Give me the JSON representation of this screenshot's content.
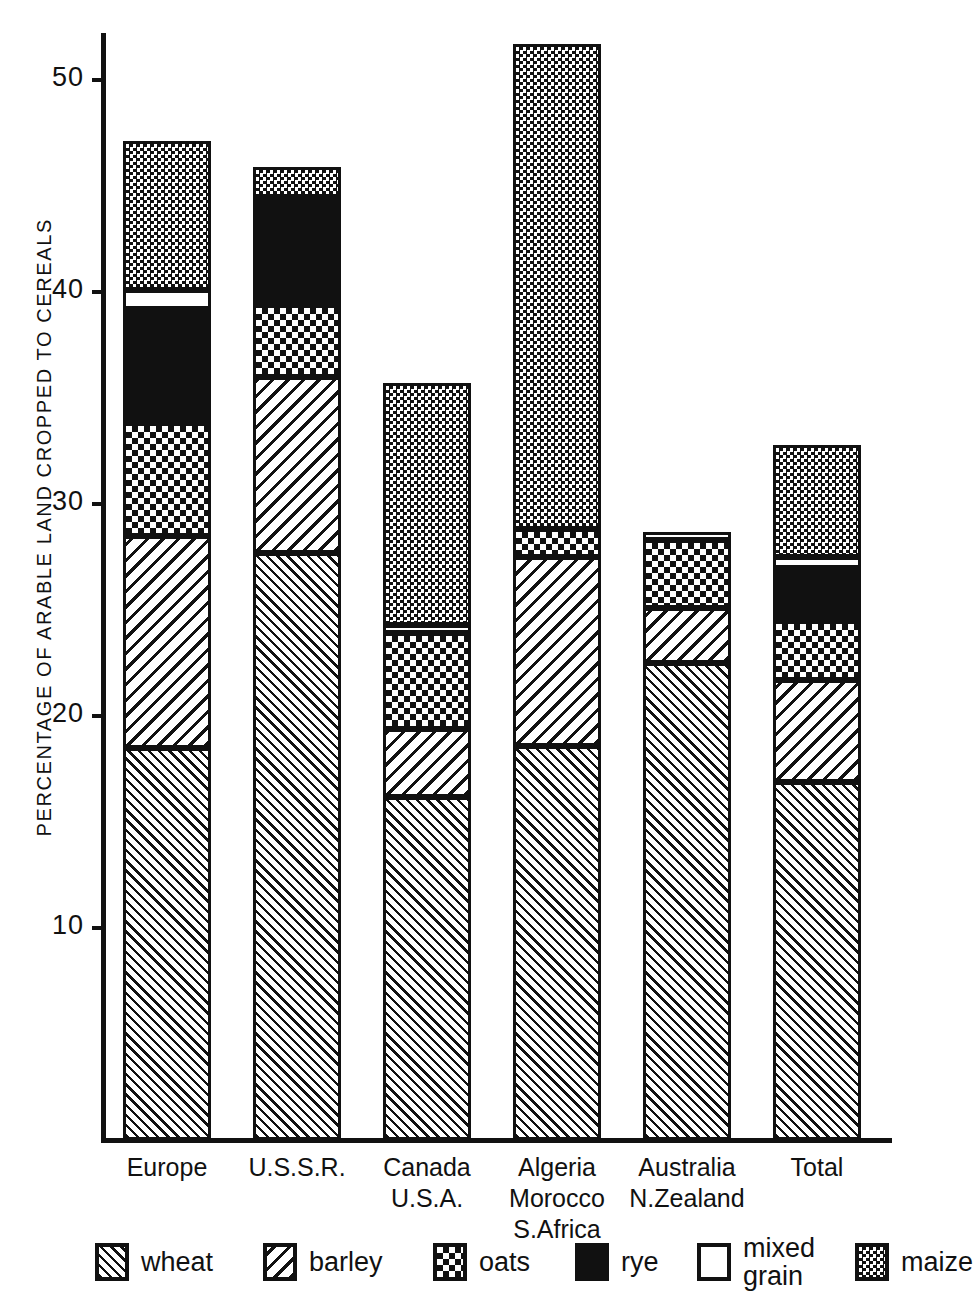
{
  "chart_data": {
    "type": "bar",
    "subtype": "stacked-bar",
    "title": "",
    "xlabel": "",
    "ylabel": "PERCENTAGE OF ARABLE LAND CROPPED TO CEREALS",
    "ylim": [
      0,
      53
    ],
    "yticks": [
      10,
      20,
      30,
      40,
      50
    ],
    "grid": false,
    "legend_position": "bottom",
    "categories": [
      "Europe",
      "U.S.S.R.",
      "Canada\nU.S.A.",
      "Algeria\nMorocco\nS.Africa",
      "Australia\nN.Zealand",
      "Total"
    ],
    "series": [
      {
        "name": "wheat",
        "values": [
          18.5,
          27.7,
          16.2,
          18.6,
          22.5,
          16.9
        ]
      },
      {
        "name": "barley",
        "values": [
          10.0,
          8.3,
          3.2,
          8.9,
          2.6,
          4.8
        ]
      },
      {
        "name": "oats",
        "values": [
          5.3,
          3.4,
          4.5,
          1.3,
          3.2,
          2.8
        ]
      },
      {
        "name": "rye",
        "values": [
          5.4,
          5.1,
          0.0,
          0.0,
          0.0,
          2.5
        ]
      },
      {
        "name": "mixed grain",
        "values": [
          0.9,
          0.0,
          0.4,
          0.0,
          0.4,
          0.5
        ]
      },
      {
        "name": "maize",
        "values": [
          7.0,
          1.4,
          11.4,
          22.9,
          0.0,
          5.3
        ]
      }
    ],
    "totals": [
      47.1,
      45.9,
      35.7,
      51.7,
      28.7,
      32.8
    ]
  },
  "legend": {
    "items": [
      {
        "label": "wheat",
        "pattern": "diagonal-hatch-right"
      },
      {
        "label": "barley",
        "pattern": "diagonal-hatch-left"
      },
      {
        "label": "oats",
        "pattern": "checker-coarse"
      },
      {
        "label": "rye",
        "pattern": "solid-black"
      },
      {
        "label": "mixed\ngrain",
        "pattern": "empty-white"
      },
      {
        "label": "maize",
        "pattern": "checker-fine"
      }
    ]
  }
}
